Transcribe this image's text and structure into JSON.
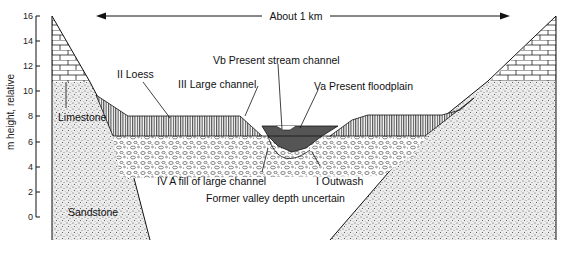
{
  "figure": {
    "scale_label": "About 1 km",
    "y_axis": {
      "label": "m height, relative",
      "ticks": [
        "0",
        "2",
        "4",
        "6",
        "8",
        "10",
        "12",
        "14",
        "16"
      ]
    },
    "units": {
      "limestone": "Limestone",
      "sandstone": "Sandstone",
      "outwash": "I Outwash",
      "loess": "II Loess",
      "large_channel": "III Large channel",
      "fill_large_channel": "IV A fill of large channel",
      "present_floodplain": "Va Present floodplain",
      "present_stream_channel": "Vb Present stream channel",
      "note": "Former valley depth uncertain"
    },
    "colors": {
      "line": "#111111",
      "stream_fill": "#555555",
      "sand_bg": "#e6e6e6"
    }
  }
}
